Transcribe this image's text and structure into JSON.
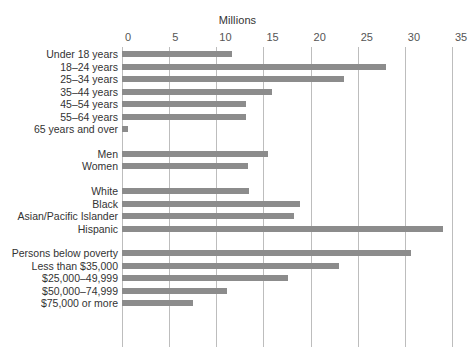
{
  "chart": {
    "type": "bar",
    "orientation": "horizontal",
    "axis_title": "Millions",
    "bar_color": "#8c8c8c",
    "gridline_color": "#bdbdbd",
    "text_color": "#333333"
  },
  "chart_data": {
    "type": "bar",
    "title": "",
    "subtitle": "",
    "xlabel": "Millions",
    "ylabel": "",
    "xlim": [
      0,
      35
    ],
    "ylim": null,
    "grid": "vertical",
    "legend": "none",
    "orientation": "horizontal",
    "tick_labels": [
      "0",
      "5",
      "10",
      "15",
      "20",
      "25",
      "30",
      "35"
    ],
    "ticks": [
      0,
      5,
      10,
      15,
      20,
      25,
      30,
      35
    ],
    "groups": [
      {
        "name": "Age",
        "categories": [
          "Under 18 years",
          "18–24 years",
          "25–34 years",
          "35–44 years",
          "45–54 years",
          "55–64 years",
          "65 years and over"
        ],
        "values": [
          11.7,
          28.0,
          23.5,
          15.9,
          13.1,
          13.2,
          0.6
        ]
      },
      {
        "name": "Sex",
        "categories": [
          "Men",
          "Women"
        ],
        "values": [
          15.5,
          13.4
        ]
      },
      {
        "name": "Race and Hispanic origin",
        "categories": [
          "White",
          "Black",
          "Asian/Pacific Islander",
          "Hispanic"
        ],
        "values": [
          13.5,
          18.9,
          18.2,
          34.0
        ]
      },
      {
        "name": "Income and poverty status",
        "categories": [
          "Persons below poverty",
          "Less than $35,000",
          "$25,000–49,999",
          "$50,000–74,999",
          "$75,000 or more"
        ],
        "values": [
          30.7,
          23.0,
          17.6,
          11.1,
          7.5
        ]
      }
    ],
    "categories": [
      "Under 18 years",
      "18–24 years",
      "25–34 years",
      "35–44 years",
      "45–54 years",
      "55–64 years",
      "65 years and over",
      "Men",
      "Women",
      "White",
      "Black",
      "Asian/Pacific Islander",
      "Hispanic",
      "Persons below poverty",
      "Less than $35,000",
      "$25,000–49,999",
      "$50,000–74,999",
      "$75,000 or more"
    ],
    "values": [
      11.7,
      28.0,
      23.5,
      15.9,
      13.1,
      13.2,
      0.6,
      15.5,
      13.4,
      13.5,
      18.9,
      18.2,
      34.0,
      30.7,
      23.0,
      17.6,
      11.1,
      7.5
    ]
  }
}
